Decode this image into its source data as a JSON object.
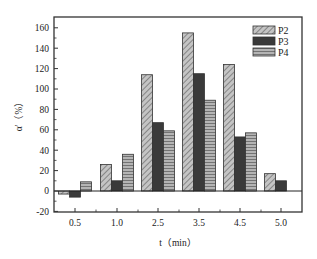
{
  "chart_data": {
    "type": "bar",
    "title": "",
    "xlabel": "t（min）",
    "ylabel": "α'（%）",
    "categories": [
      "0.5",
      "1.0",
      "2.5",
      "3.5",
      "4.5",
      "5.0"
    ],
    "series": [
      {
        "name": "P2",
        "pattern": "diagonal-hatch",
        "color": "#a8a8a8",
        "values": [
          -3,
          26,
          114,
          155,
          124,
          17
        ]
      },
      {
        "name": "P3",
        "pattern": "solid-dark",
        "color": "#3a3a3a",
        "values": [
          -6,
          10,
          67,
          115,
          53,
          10
        ]
      },
      {
        "name": "P4",
        "pattern": "horizontal-hatch",
        "color": "#9a9a9a",
        "values": [
          9,
          36,
          59,
          89,
          57,
          null
        ]
      }
    ],
    "ylim": [
      -20,
      170
    ],
    "yticks": [
      -20,
      0,
      20,
      40,
      60,
      80,
      100,
      120,
      140,
      160
    ],
    "ytick_labels": [
      "-20",
      "0",
      "20",
      "40",
      "60",
      "80",
      "100",
      "120",
      "140",
      "160"
    ],
    "grid": false,
    "legend_position": "upper right",
    "zero_line": true
  },
  "layout": {
    "frame": {
      "left": 54,
      "top": 17,
      "right": 302,
      "bottom": 212
    },
    "y_zero_px": 191,
    "px_per_unit": 1.02,
    "x_centers": [
      75,
      117,
      158,
      199,
      240,
      281
    ],
    "bar_width": 11
  }
}
